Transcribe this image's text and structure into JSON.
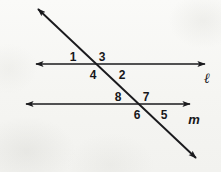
{
  "figure": {
    "width": 221,
    "height": 172,
    "background_color": "#f7f7f5",
    "ink_color": "#1a1a1d"
  },
  "lines": [
    {
      "id": "line-l",
      "label": "ℓ",
      "label_x": 207,
      "label_y": 79,
      "x1": 36,
      "y1": 64,
      "x2": 205,
      "y2": 64,
      "arrow_start": true,
      "arrow_end": true
    },
    {
      "id": "line-m",
      "label": "m",
      "label_x": 194,
      "label_y": 119,
      "x1": 26,
      "y1": 104,
      "x2": 190,
      "y2": 104,
      "arrow_start": true,
      "arrow_end": true
    },
    {
      "id": "transversal",
      "label": "",
      "label_x": 0,
      "label_y": 0,
      "x1": 38,
      "y1": 9,
      "x2": 196,
      "y2": 158,
      "arrow_start": true,
      "arrow_end": true
    }
  ],
  "intersections": [
    {
      "id": "upper-vertex",
      "x": 105,
      "y": 64
    },
    {
      "id": "lower-vertex",
      "x": 141,
      "y": 104
    }
  ],
  "angle_labels": [
    {
      "id": "angle-1",
      "text": "1",
      "x": 73,
      "y": 57,
      "vertex": "upper-vertex",
      "position": "upper-left"
    },
    {
      "id": "angle-3",
      "text": "3",
      "x": 102,
      "y": 57,
      "vertex": "upper-vertex",
      "position": "upper-right"
    },
    {
      "id": "angle-4",
      "text": "4",
      "x": 93,
      "y": 75,
      "vertex": "upper-vertex",
      "position": "lower-left"
    },
    {
      "id": "angle-2",
      "text": "2",
      "x": 122,
      "y": 75,
      "vertex": "upper-vertex",
      "position": "lower-right"
    },
    {
      "id": "angle-8",
      "text": "8",
      "x": 118,
      "y": 97,
      "vertex": "lower-vertex",
      "position": "upper-left"
    },
    {
      "id": "angle-7",
      "text": "7",
      "x": 146,
      "y": 97,
      "vertex": "lower-vertex",
      "position": "upper-right"
    },
    {
      "id": "angle-6",
      "text": "6",
      "x": 137,
      "y": 115,
      "vertex": "lower-vertex",
      "position": "lower-left"
    },
    {
      "id": "angle-5",
      "text": "5",
      "x": 164,
      "y": 115,
      "vertex": "lower-vertex",
      "position": "lower-right"
    }
  ]
}
